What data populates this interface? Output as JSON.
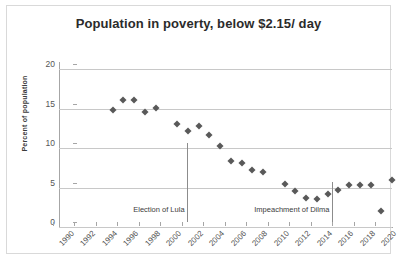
{
  "chart_data": {
    "type": "scatter",
    "title": "Population in poverty, below $2.15/ day",
    "xlabel": "",
    "ylabel": "Percent of population",
    "ylim": [
      0,
      20
    ],
    "yticks": [
      0,
      5,
      10,
      15,
      20
    ],
    "xlim": [
      1990,
      2021
    ],
    "xticks": [
      1990,
      1992,
      1994,
      1996,
      1998,
      2000,
      2002,
      2004,
      2006,
      2008,
      2010,
      2012,
      2014,
      2016,
      2018,
      2020
    ],
    "grid": true,
    "legend": "none",
    "marker": "diamond",
    "marker_color": "#595959",
    "series": [
      {
        "name": "Percent of population in poverty",
        "points": [
          {
            "x": 1995,
            "y": 14.8
          },
          {
            "x": 1996,
            "y": 16.1
          },
          {
            "x": 1997,
            "y": 16.1
          },
          {
            "x": 1998,
            "y": 14.5
          },
          {
            "x": 1999,
            "y": 15.1
          },
          {
            "x": 2001,
            "y": 13.0
          },
          {
            "x": 2002,
            "y": 12.2
          },
          {
            "x": 2003,
            "y": 12.8
          },
          {
            "x": 2004,
            "y": 11.6
          },
          {
            "x": 2005,
            "y": 10.2
          },
          {
            "x": 2006,
            "y": 8.4
          },
          {
            "x": 2007,
            "y": 8.1
          },
          {
            "x": 2008,
            "y": 7.2
          },
          {
            "x": 2009,
            "y": 6.9
          },
          {
            "x": 2011,
            "y": 5.5
          },
          {
            "x": 2012,
            "y": 4.5
          },
          {
            "x": 2013,
            "y": 3.7
          },
          {
            "x": 2014,
            "y": 3.5
          },
          {
            "x": 2015,
            "y": 4.2
          },
          {
            "x": 2016,
            "y": 4.7
          },
          {
            "x": 2017,
            "y": 5.3
          },
          {
            "x": 2018,
            "y": 5.3
          },
          {
            "x": 2019,
            "y": 5.3
          },
          {
            "x": 2020,
            "y": 2.0
          },
          {
            "x": 2021,
            "y": 5.9
          }
        ]
      }
    ],
    "annotations": [
      {
        "label": "Election of Lula",
        "x": 2002.5,
        "type": "vertical-line"
      },
      {
        "label": "Impeachment of Dilma",
        "x": 2016.0,
        "type": "vertical-line"
      }
    ]
  },
  "axis": {
    "y_labels": [
      "20",
      "15",
      "10",
      "5",
      "0"
    ],
    "y_title": "Percent of population",
    "x_labels": [
      "1990",
      "1992",
      "1994",
      "1996",
      "1998",
      "2000",
      "2002",
      "2004",
      "2006",
      "2008",
      "2010",
      "2012",
      "2014",
      "2016",
      "2018",
      "2020"
    ]
  },
  "annotations": {
    "lula": "Election of Lula",
    "dilma": "Impeachment of Dilma"
  },
  "colors": {
    "marker": "#595959",
    "grid": "#c8c8c8",
    "axis": "#a6a6a6",
    "border": "#d9d9d9",
    "title_text": "#2b2b2b"
  }
}
